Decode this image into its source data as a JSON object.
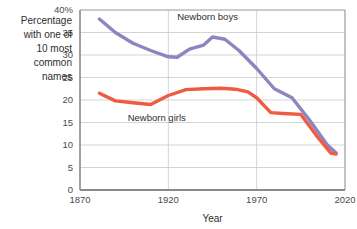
{
  "chart_data": {
    "type": "line",
    "title": "",
    "xlabel": "Year",
    "ylabel": "Percentage with one of 10 most common names",
    "ylabel_lines": [
      "Percentage",
      "with one of",
      "10 most",
      "common",
      "names"
    ],
    "xlim": [
      1870,
      2020
    ],
    "ylim": [
      0,
      40
    ],
    "grid": true,
    "legend_position": "inline-annotation",
    "y_ticks": [
      0,
      5,
      10,
      15,
      20,
      25,
      30,
      35,
      40
    ],
    "y_tick_labels": [
      "0",
      "5",
      "10",
      "15",
      "20",
      "25",
      "30",
      "35",
      "40%"
    ],
    "x_ticks": [
      1870,
      1920,
      1970,
      2020
    ],
    "x_tick_labels": [
      "1870",
      "1920",
      "1970",
      "2020"
    ],
    "series": [
      {
        "name": "Newborn boys",
        "color": "#8b85c0",
        "label_x": 1925,
        "label_y": 38.5,
        "x": [
          1881,
          1890,
          1900,
          1910,
          1920,
          1925,
          1932,
          1940,
          1945,
          1952,
          1960,
          1970,
          1980,
          1990,
          2000,
          2010,
          2015
        ],
        "values": [
          38.0,
          35.0,
          32.6,
          31.0,
          29.6,
          29.5,
          31.3,
          32.2,
          34.0,
          33.5,
          31.0,
          27.0,
          22.5,
          20.5,
          15.5,
          10.0,
          8.2
        ]
      },
      {
        "name": "Newborn girls",
        "color": "#ef5a43",
        "label_x": 1897,
        "label_y": 16.2,
        "x": [
          1881,
          1890,
          1900,
          1910,
          1920,
          1930,
          1940,
          1950,
          1958,
          1965,
          1970,
          1978,
          1985,
          1995,
          2005,
          2012,
          2015
        ],
        "values": [
          21.5,
          19.8,
          19.4,
          19.0,
          21.0,
          22.3,
          22.5,
          22.6,
          22.4,
          21.8,
          20.5,
          17.2,
          17.0,
          16.8,
          11.5,
          8.2,
          8.0
        ]
      }
    ]
  }
}
